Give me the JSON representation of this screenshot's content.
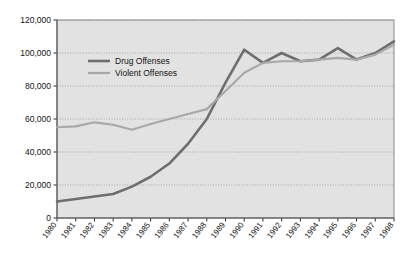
{
  "chart_data": {
    "type": "line",
    "title": "",
    "subtitle": "",
    "xlabel": "",
    "ylabel": "",
    "grid": true,
    "legend_position": "inside-top-left",
    "xlim": [
      1980,
      1998
    ],
    "ylim": [
      0,
      120000
    ],
    "ytick_labels": [
      "120,000",
      "100,000",
      "80,000",
      "60,000",
      "40,000",
      "20,000",
      "0"
    ],
    "ytick_values": [
      120000,
      100000,
      80000,
      60000,
      40000,
      20000,
      0
    ],
    "categories": [
      "1980",
      "1981",
      "1982",
      "1983",
      "1984",
      "1985",
      "1986",
      "1987",
      "1988",
      "1989",
      "1990",
      "1991",
      "1992",
      "1993",
      "1994",
      "1995",
      "1996",
      "1997",
      "1998"
    ],
    "x": [
      1980,
      1981,
      1982,
      1983,
      1984,
      1985,
      1986,
      1987,
      1988,
      1989,
      1990,
      1991,
      1992,
      1993,
      1994,
      1995,
      1996,
      1997,
      1998
    ],
    "series": [
      {
        "name": "Drug Offenses",
        "color": "#6e6e6e",
        "width": 2.6,
        "values": [
          10000,
          11500,
          13000,
          14500,
          19000,
          25000,
          33000,
          45000,
          60000,
          82000,
          102000,
          94000,
          100000,
          95000,
          96000,
          103000,
          96000,
          100000,
          107000
        ]
      },
      {
        "name": "Violent Offenses",
        "color": "#a8a8a8",
        "width": 2.2,
        "values": [
          55000,
          55500,
          58000,
          56500,
          53500,
          57000,
          60000,
          63000,
          66000,
          77000,
          88000,
          94000,
          95000,
          95000,
          96000,
          97000,
          96000,
          99000,
          105000
        ]
      }
    ]
  },
  "legend": {
    "items": [
      {
        "label": "Drug Offenses",
        "color": "#6e6e6e"
      },
      {
        "label": "Violent Offenses",
        "color": "#a8a8a8"
      }
    ]
  },
  "style": {
    "plot_background": "#e2e2e2",
    "plot_border": "#8a8a8a",
    "gridline_color": "#9a9a9a",
    "page_background": "#ffffff",
    "text_color": "#141414"
  }
}
